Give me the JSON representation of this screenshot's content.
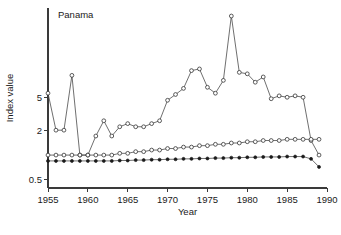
{
  "chart_data": {
    "type": "line",
    "title": "Panama",
    "xlabel": "Year",
    "ylabel": "Index value",
    "yscale": "log",
    "xlim": [
      1955,
      1990
    ],
    "ylim": [
      0.4,
      60
    ],
    "xticks": [
      1955,
      1960,
      1965,
      1970,
      1975,
      1980,
      1985,
      1990
    ],
    "xticklabels": [
      "1955",
      "1960",
      "1965",
      "1970",
      "1975",
      "1980",
      "1985",
      "1990"
    ],
    "yticks": [
      5,
      2,
      0.5
    ],
    "yticklabels": [
      "5",
      "2",
      "0.5"
    ],
    "grid": false,
    "legend": "none",
    "x": [
      1955,
      1956,
      1957,
      1958,
      1959,
      1960,
      1961,
      1962,
      1963,
      1964,
      1965,
      1966,
      1967,
      1968,
      1969,
      1970,
      1971,
      1972,
      1973,
      1974,
      1975,
      1976,
      1977,
      1978,
      1979,
      1980,
      1981,
      1982,
      1983,
      1984,
      1985,
      1986,
      1987,
      1988,
      1989
    ],
    "series": [
      {
        "name": "upper-series",
        "marker": "open-circle",
        "values": [
          5.6,
          2.0,
          2.0,
          9.2,
          1.0,
          1.0,
          1.7,
          2.6,
          1.7,
          2.2,
          2.4,
          2.2,
          2.2,
          2.4,
          2.6,
          4.6,
          5.4,
          6.4,
          10.5,
          11.0,
          6.6,
          5.6,
          8.0,
          48.0,
          10.0,
          9.6,
          7.6,
          8.8,
          4.8,
          5.2,
          5.0,
          5.2,
          5.0,
          1.5,
          1.0
        ]
      },
      {
        "name": "middle-series",
        "marker": "open-circle",
        "values": [
          1.0,
          1.0,
          1.0,
          1.0,
          1.0,
          1.0,
          1.0,
          1.0,
          1.0,
          1.05,
          1.05,
          1.1,
          1.1,
          1.15,
          1.15,
          1.2,
          1.2,
          1.25,
          1.25,
          1.3,
          1.3,
          1.35,
          1.35,
          1.4,
          1.4,
          1.45,
          1.45,
          1.5,
          1.5,
          1.5,
          1.55,
          1.55,
          1.55,
          1.55,
          1.55
        ]
      },
      {
        "name": "lower-series",
        "marker": "filled-circle",
        "values": [
          0.85,
          0.85,
          0.85,
          0.85,
          0.85,
          0.85,
          0.85,
          0.85,
          0.85,
          0.86,
          0.86,
          0.87,
          0.87,
          0.88,
          0.88,
          0.89,
          0.89,
          0.9,
          0.9,
          0.91,
          0.91,
          0.92,
          0.92,
          0.93,
          0.93,
          0.94,
          0.94,
          0.95,
          0.95,
          0.95,
          0.96,
          0.96,
          0.96,
          0.9,
          0.72
        ]
      }
    ]
  }
}
